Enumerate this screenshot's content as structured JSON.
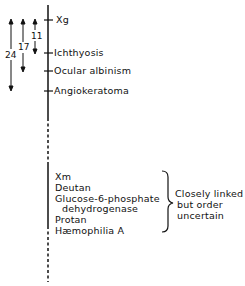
{
  "diagram": {
    "type": "genetic-map",
    "title": "",
    "markers": [
      {
        "label": "Xg",
        "y": 20
      },
      {
        "label": "Ichthyosis",
        "y": 53
      },
      {
        "label": "Ocular albinism",
        "y": 71
      },
      {
        "label": "Angiokeratoma",
        "y": 91
      }
    ],
    "distances": [
      {
        "value": "11",
        "from": "Xg",
        "to": "Ichthyosis"
      },
      {
        "value": "17",
        "from": "Xg",
        "to": "Ocular albinism"
      },
      {
        "value": "24",
        "from": "Xg",
        "to": "Angiokeratoma"
      }
    ],
    "cluster": {
      "items": [
        "Xm",
        "Deutan",
        "Glucose-6-phosphate",
        "dehydrogenase",
        "Protan",
        "Hæmophilia A"
      ],
      "note_lines": [
        "Closely linked",
        "but order",
        "uncertain"
      ]
    }
  }
}
